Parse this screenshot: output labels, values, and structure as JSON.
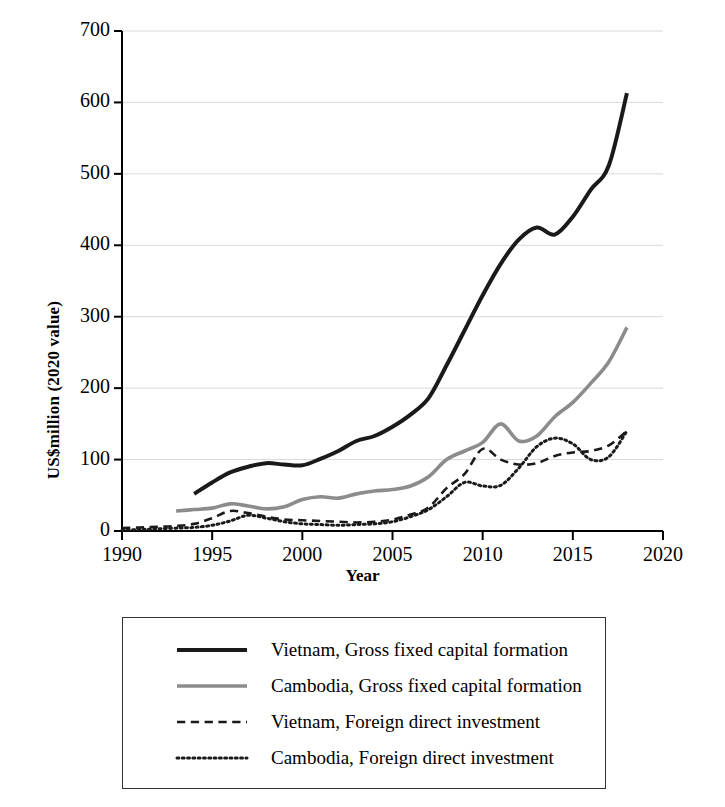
{
  "chart_data": {
    "type": "line",
    "title": "",
    "xlabel": "Year",
    "ylabel": "US$million (2020 value)",
    "xlim": [
      1990,
      2020
    ],
    "ylim": [
      0,
      700
    ],
    "xticks": [
      "1990",
      "1995",
      "2000",
      "2005",
      "2010",
      "2015",
      "2020"
    ],
    "yticks": [
      "0",
      "100",
      "200",
      "300",
      "400",
      "500",
      "600",
      "700"
    ],
    "grid": "horizontal",
    "legend_position": "below-plot",
    "series": [
      {
        "name": "Vietnam, Gross fixed capital formation",
        "style": "solid",
        "color": "#1a1a1a",
        "width": 4,
        "x": [
          1994,
          1995,
          1996,
          1997,
          1998,
          1999,
          2000,
          2001,
          2002,
          2003,
          2004,
          2005,
          2006,
          2007,
          2008,
          2009,
          2010,
          2011,
          2012,
          2013,
          2014,
          2015,
          2016,
          2017,
          2018
        ],
        "values": [
          52,
          68,
          82,
          90,
          95,
          93,
          92,
          101,
          112,
          126,
          133,
          146,
          163,
          186,
          232,
          281,
          330,
          374,
          408,
          425,
          415,
          440,
          478,
          512,
          613
        ]
      },
      {
        "name": "Cambodia, Gross fixed capital formation",
        "style": "solid",
        "color": "#8c8c8c",
        "width": 3.6,
        "x": [
          1993,
          1994,
          1995,
          1996,
          1997,
          1998,
          1999,
          2000,
          2001,
          2002,
          2003,
          2004,
          2005,
          2006,
          2007,
          2008,
          2009,
          2010,
          2011,
          2012,
          2013,
          2014,
          2015,
          2016,
          2017,
          2018
        ],
        "values": [
          28,
          30,
          32,
          38,
          35,
          31,
          34,
          44,
          48,
          46,
          52,
          56,
          58,
          63,
          76,
          100,
          112,
          124,
          150,
          126,
          133,
          160,
          180,
          207,
          237,
          285
        ]
      },
      {
        "name": "Vietnam, Foreign direct investment",
        "style": "dashed",
        "color": "#1a1a1a",
        "width": 2.6,
        "x": [
          1990,
          1991,
          1992,
          1993,
          1994,
          1995,
          1996,
          1997,
          1998,
          1999,
          2000,
          2001,
          2002,
          2003,
          2004,
          2005,
          2006,
          2007,
          2008,
          2009,
          2010,
          2011,
          2012,
          2013,
          2014,
          2015,
          2016,
          2017,
          2018
        ],
        "values": [
          4,
          5,
          6,
          7,
          10,
          18,
          28,
          25,
          20,
          16,
          15,
          14,
          13,
          12,
          13,
          16,
          23,
          33,
          60,
          80,
          115,
          100,
          93,
          95,
          105,
          110,
          112,
          120,
          140
        ]
      },
      {
        "name": "Cambodia, Foreign direct investment",
        "style": "dotted",
        "color": "#1a1a1a",
        "width": 3.0,
        "x": [
          1990,
          1991,
          1992,
          1993,
          1994,
          1995,
          1996,
          1997,
          1998,
          1999,
          2000,
          2001,
          2002,
          2003,
          2004,
          2005,
          2006,
          2007,
          2008,
          2009,
          2010,
          2011,
          2012,
          2013,
          2014,
          2015,
          2016,
          2017,
          2018
        ],
        "values": [
          1,
          2,
          3,
          4,
          5,
          8,
          14,
          22,
          18,
          13,
          10,
          9,
          8,
          9,
          10,
          13,
          20,
          30,
          48,
          68,
          63,
          64,
          88,
          118,
          130,
          122,
          100,
          104,
          140
        ]
      }
    ]
  },
  "legend": {
    "items": [
      {
        "label": "Vietnam, Gross fixed capital formation",
        "swatch": "solid-black-line-swatch"
      },
      {
        "label": "Cambodia, Gross fixed capital formation",
        "swatch": "solid-gray-line-swatch"
      },
      {
        "label": "Vietnam, Foreign direct investment",
        "swatch": "dashed-black-line-swatch"
      },
      {
        "label": "Cambodia, Foreign direct investment",
        "swatch": "dotted-black-line-swatch"
      }
    ]
  },
  "colors": {
    "vietnam": "#1a1a1a",
    "cambodia": "#8c8c8c",
    "axis": "#000000",
    "grid": "#d8d8d8",
    "background": "#ffffff"
  }
}
